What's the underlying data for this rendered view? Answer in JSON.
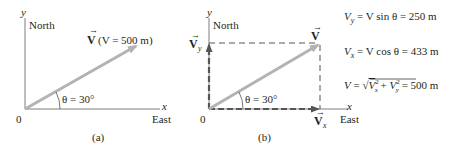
{
  "panel_a": {
    "caption": "(a)",
    "axis_y_label": "y",
    "axis_y_direction": "North",
    "axis_x_label": "x",
    "axis_x_direction": "East",
    "origin_label": "0",
    "vector_symbol": "V",
    "vector_magnitude": "(V = 500 m)",
    "angle_label": "θ = 30°"
  },
  "panel_b": {
    "caption": "(b)",
    "axis_y_label": "y",
    "axis_y_direction": "North",
    "axis_x_label": "x",
    "axis_x_direction": "East",
    "origin_label": "0",
    "vector_symbol": "V",
    "vy_symbol": "V",
    "vy_sub": "y",
    "vx_symbol": "V",
    "vx_sub": "x",
    "angle_label": "θ = 30°"
  },
  "equations": {
    "vy": {
      "lhs": "V",
      "sub": "y",
      "rhs": " = V sin θ = 250 m"
    },
    "vx": {
      "lhs": "V",
      "sub": "x",
      "rhs": " = V cos θ = 433 m"
    },
    "mag": {
      "text": "V = √(V",
      "sub_x": "x",
      "sup": "2",
      "plus": " + V",
      "sub_y": "y",
      "end": ") = 500 m"
    }
  },
  "colors": {
    "vector": "#b3b3b3",
    "axis": "#7f7f7f",
    "dashed": "#555555",
    "text": "#231f20"
  }
}
